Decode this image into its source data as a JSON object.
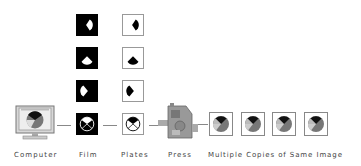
{
  "diagram": {
    "stages": [
      {
        "id": "computer",
        "label": "Computer"
      },
      {
        "id": "film",
        "label": "Film"
      },
      {
        "id": "plates",
        "label": "Plates"
      },
      {
        "id": "press",
        "label": "Press"
      },
      {
        "id": "copies",
        "label": "Multiple Copies of Same Image"
      }
    ],
    "separations": [
      "top-right wedge",
      "bottom wedge",
      "left wedge",
      "composite"
    ],
    "copy_count": 4,
    "colors": {
      "film_bg": "#000000",
      "plate_border": "#999999",
      "connector": "#888888",
      "label_text": "#444444",
      "image_dark": "#111111",
      "image_mid": "#777777",
      "image_light": "#cccccc"
    }
  }
}
